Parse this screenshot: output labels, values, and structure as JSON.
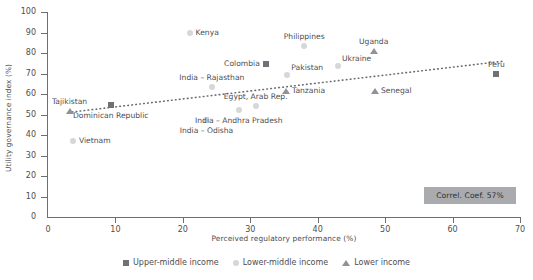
{
  "chart_data": {
    "type": "scatter",
    "title": "",
    "xlabel": "Perceived regulatory performance (%)",
    "ylabel": "Utility governance index (%)",
    "xlim": [
      0,
      70
    ],
    "ylim": [
      0,
      100
    ],
    "xticks": [
      0,
      10,
      20,
      30,
      40,
      50,
      60,
      70
    ],
    "yticks": [
      0,
      10,
      20,
      30,
      40,
      50,
      60,
      70,
      80,
      90,
      100
    ],
    "grid": false,
    "legend_position": "bottom",
    "annotation": "Correl. Coef. 57%",
    "trendline": {
      "type": "dotted-linear",
      "x0": 3.0,
      "y0": 51.0,
      "x1": 67.5,
      "y1": 76.0
    },
    "series": [
      {
        "name": "Upper-middle income",
        "marker": "square",
        "color": "#6f7175",
        "points": [
          {
            "label": "Dominican Republic",
            "x": 9.3,
            "y": 54.5,
            "label_pos": "below-center"
          },
          {
            "label": "Colombia",
            "x": 32.3,
            "y": 74.5,
            "label_pos": "left"
          },
          {
            "label": "Peru",
            "x": 66.5,
            "y": 70.0,
            "label_pos": "above-center"
          }
        ]
      },
      {
        "name": "Lower-middle income",
        "marker": "circle",
        "color": "#d6d7d9",
        "points": [
          {
            "label": "Vietnam",
            "x": 3.7,
            "y": 37.0,
            "label_pos": "right"
          },
          {
            "label": "Kenya",
            "x": 21.0,
            "y": 90.0,
            "label_pos": "right"
          },
          {
            "label": "India – Rajasthan",
            "x": 24.3,
            "y": 63.5,
            "label_pos": "above-center"
          },
          {
            "label": "India – Odisha",
            "x": 23.5,
            "y": 47.5,
            "label_pos": "below-center"
          },
          {
            "label": "Egypt, Arab Rep.",
            "x": 30.8,
            "y": 54.0,
            "label_pos": "above-center"
          },
          {
            "label": "India – Andhra Pradesh",
            "x": 28.3,
            "y": 52.0,
            "label_pos": "below-center"
          },
          {
            "label": "Philippines",
            "x": 38.0,
            "y": 83.5,
            "label_pos": "above-center"
          },
          {
            "label": "Pakistan",
            "x": 35.5,
            "y": 69.5,
            "label_pos": "above-right"
          },
          {
            "label": "Ukraine",
            "x": 43.0,
            "y": 73.5,
            "label_pos": "above-right"
          }
        ]
      },
      {
        "name": "Lower income",
        "marker": "triangle",
        "color": "#909296",
        "points": [
          {
            "label": "Tajikistan",
            "x": 3.2,
            "y": 51.5,
            "label_pos": "above-center"
          },
          {
            "label": "Tanzania",
            "x": 35.3,
            "y": 61.5,
            "label_pos": "right"
          },
          {
            "label": "Senegal",
            "x": 48.5,
            "y": 61.5,
            "label_pos": "right"
          },
          {
            "label": "Uganda",
            "x": 48.3,
            "y": 81.0,
            "label_pos": "above-center"
          }
        ]
      }
    ]
  },
  "legend": {
    "items": [
      {
        "label": "Upper-middle income",
        "marker": "square"
      },
      {
        "label": "Lower-middle income",
        "marker": "circle"
      },
      {
        "label": "Lower income",
        "marker": "triangle"
      }
    ]
  }
}
